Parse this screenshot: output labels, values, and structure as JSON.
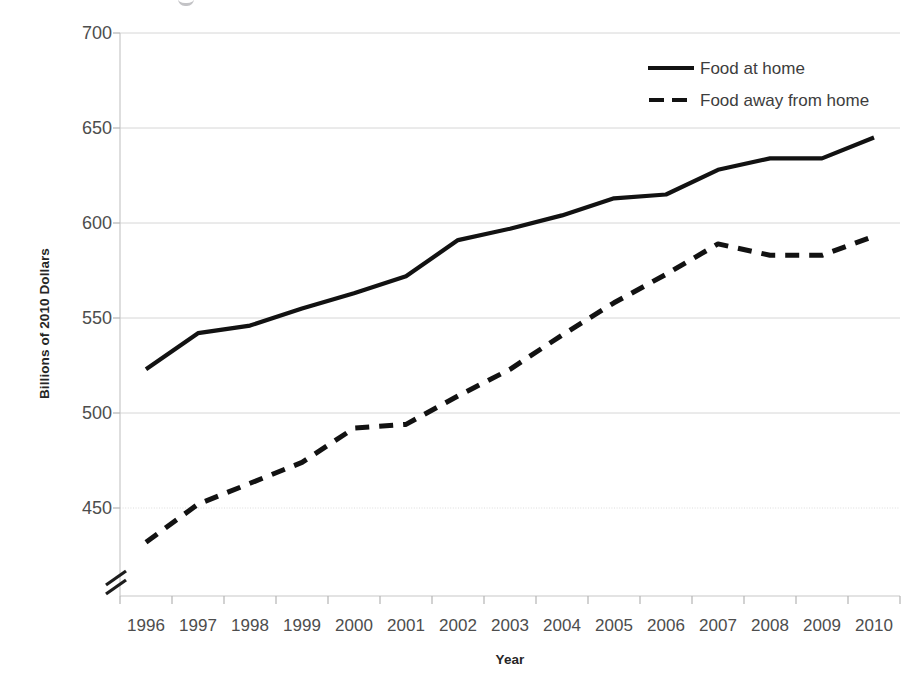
{
  "chart_data": {
    "type": "line",
    "title": "",
    "xlabel": "Year",
    "ylabel": "Billions of 2010 Dollars",
    "x": [
      1996,
      1997,
      1998,
      1999,
      2000,
      2001,
      2002,
      2003,
      2004,
      2005,
      2006,
      2007,
      2008,
      2009,
      2010
    ],
    "categories": [
      "1996",
      "1997",
      "1998",
      "1999",
      "2000",
      "2001",
      "2002",
      "2003",
      "2004",
      "2005",
      "2006",
      "2007",
      "2008",
      "2009",
      "2010"
    ],
    "xlim": [
      1995.5,
      2010.5
    ],
    "ylim": [
      430,
      700
    ],
    "yticks": [
      450,
      500,
      550,
      600,
      650,
      700
    ],
    "ytick_labels": [
      "450",
      "500",
      "550",
      "600",
      "650",
      "700"
    ],
    "y_axis_break": true,
    "y_axis_break_symbol": "//",
    "grid": "horizontal",
    "legend_position": "top-right",
    "series": [
      {
        "name": "Food at home",
        "style": "solid",
        "color": "#121212",
        "values": [
          523,
          542,
          546,
          555,
          563,
          572,
          591,
          597,
          604,
          613,
          615,
          628,
          634,
          634,
          645
        ]
      },
      {
        "name": "Food away from home",
        "style": "dashed",
        "color": "#121212",
        "values": [
          432,
          452,
          463,
          474,
          492,
          494,
          509,
          523,
          541,
          558,
          573,
          589,
          583,
          583,
          593
        ]
      }
    ]
  },
  "axes": {
    "y_title": "Billions of 2010 Dollars",
    "x_title": "Year"
  },
  "legend": {
    "items": [
      {
        "label": "Food at home",
        "style": "solid"
      },
      {
        "label": "Food away from home",
        "style": "dashed"
      }
    ]
  }
}
